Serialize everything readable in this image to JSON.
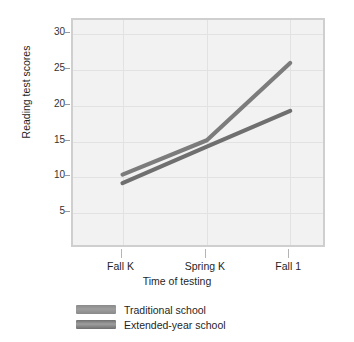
{
  "chart_data": {
    "type": "line",
    "title": "",
    "xlabel": "Time of testing",
    "ylabel": "Reading test scores",
    "categories": [
      "Fall K",
      "Spring K",
      "Fall 1"
    ],
    "x_tick_labels": [
      "Fall K",
      "Spring K",
      "Fall 1"
    ],
    "y_tick_labels": [
      "5",
      "10",
      "15",
      "20",
      "25",
      "30"
    ],
    "y_ticks": [
      5,
      10,
      15,
      20,
      25,
      30
    ],
    "ylim": [
      0,
      32
    ],
    "grid": true,
    "legend_position": "below-plot-left",
    "series": [
      {
        "name": "Traditional school",
        "values": [
          10.4,
          15.2,
          26.0
        ],
        "color": "#7c7c7c"
      },
      {
        "name": "Extended-year school",
        "values": [
          9.2,
          14.3,
          19.3
        ],
        "color": "#6f6f6f"
      }
    ]
  },
  "legend": {
    "items": [
      {
        "label": "Traditional school",
        "color": "#8a8a8a"
      },
      {
        "label": "Extended-year school",
        "color": "#6f6f6f"
      }
    ]
  },
  "colors": {
    "plot_background": "#f2f2f2",
    "frame": "#cfcfcf",
    "gridline": "#e2e2e2",
    "text": "#1f1f1f"
  }
}
